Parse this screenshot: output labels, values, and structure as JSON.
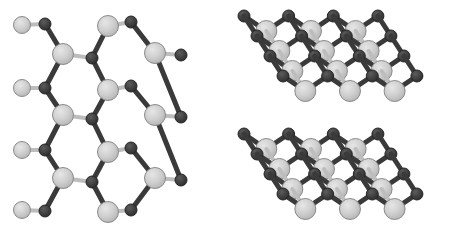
{
  "figure": {
    "title": "",
    "width": 462,
    "height": 236,
    "background": "#ffffff",
    "panels": [
      {
        "id": "left-panel",
        "name": "planar-projection",
        "label": "",
        "description": "Hexagonal lattice projection of a binary compound viewed along a principal axis"
      },
      {
        "id": "right-panel",
        "name": "layered-perspective",
        "label": "",
        "description": "Perspective view of two stacked puckered bilayers of the same binary compound"
      }
    ]
  },
  "style": {
    "atom_light_fill": "#c9c9c9",
    "atom_light_highlight": "#dedede",
    "atom_light_stroke": "#8a8a8a",
    "atom_dark_fill": "#3f3f3f",
    "atom_dark_highlight": "#565656",
    "atom_dark_stroke": "#262626",
    "bond_light_color": "#bdbdbd",
    "bond_dark_color": "#3a3a3a",
    "bond_light_width": 4,
    "bond_dark_width": 5,
    "atom_light_radius": 10.5,
    "atom_dark_radius": 7.0,
    "atom_light_radius_small": 8.5,
    "atom_dark_radius_small": 6.0
  },
  "legend": {
    "species": [
      {
        "key": "light",
        "label": "",
        "color": "#c9c9c9",
        "relative_size": "large"
      },
      {
        "key": "dark",
        "label": "",
        "color": "#3f3f3f",
        "relative_size": "small"
      }
    ]
  },
  "chart_data": {
    "type": "diagram",
    "title": "",
    "panels": [
      {
        "id": "left",
        "kind": "hexagonal-lattice-projection",
        "atoms": [
          {
            "x": 22,
            "y": 25,
            "s": "light",
            "size": "small"
          },
          {
            "x": 45,
            "y": 24,
            "s": "dark",
            "size": "small"
          },
          {
            "x": 63,
            "y": 54,
            "s": "light",
            "size": "large"
          },
          {
            "x": 92,
            "y": 58,
            "s": "dark",
            "size": "small"
          },
          {
            "x": 108,
            "y": 26,
            "s": "light",
            "size": "large"
          },
          {
            "x": 131,
            "y": 22,
            "s": "dark",
            "size": "small"
          },
          {
            "x": 155,
            "y": 53,
            "s": "light",
            "size": "large"
          },
          {
            "x": 181,
            "y": 55,
            "s": "dark",
            "size": "small"
          },
          {
            "x": 22,
            "y": 88,
            "s": "light",
            "size": "small"
          },
          {
            "x": 45,
            "y": 88,
            "s": "dark",
            "size": "small"
          },
          {
            "x": 63,
            "y": 115,
            "s": "light",
            "size": "large"
          },
          {
            "x": 92,
            "y": 119,
            "s": "dark",
            "size": "small"
          },
          {
            "x": 108,
            "y": 90,
            "s": "light",
            "size": "large"
          },
          {
            "x": 131,
            "y": 86,
            "s": "dark",
            "size": "small"
          },
          {
            "x": 155,
            "y": 115,
            "s": "light",
            "size": "large"
          },
          {
            "x": 181,
            "y": 117,
            "s": "dark",
            "size": "small"
          },
          {
            "x": 22,
            "y": 150,
            "s": "light",
            "size": "small"
          },
          {
            "x": 45,
            "y": 150,
            "s": "dark",
            "size": "small"
          },
          {
            "x": 63,
            "y": 178,
            "s": "light",
            "size": "large"
          },
          {
            "x": 92,
            "y": 182,
            "s": "dark",
            "size": "small"
          },
          {
            "x": 108,
            "y": 152,
            "s": "light",
            "size": "large"
          },
          {
            "x": 131,
            "y": 148,
            "s": "dark",
            "size": "small"
          },
          {
            "x": 155,
            "y": 178,
            "s": "light",
            "size": "large"
          },
          {
            "x": 181,
            "y": 180,
            "s": "dark",
            "size": "small"
          },
          {
            "x": 22,
            "y": 210,
            "s": "light",
            "size": "small"
          },
          {
            "x": 45,
            "y": 211,
            "s": "dark",
            "size": "small"
          },
          {
            "x": 108,
            "y": 212,
            "s": "light",
            "size": "large"
          },
          {
            "x": 131,
            "y": 210,
            "s": "dark",
            "size": "small"
          }
        ],
        "bonds": [
          [
            0,
            1,
            "light"
          ],
          [
            1,
            2,
            "dark"
          ],
          [
            2,
            3,
            "light"
          ],
          [
            3,
            4,
            "dark"
          ],
          [
            4,
            5,
            "light"
          ],
          [
            5,
            6,
            "dark"
          ],
          [
            6,
            7,
            "light"
          ],
          [
            2,
            9,
            "dark"
          ],
          [
            3,
            12,
            "dark"
          ],
          [
            6,
            15,
            "dark"
          ],
          [
            8,
            9,
            "light"
          ],
          [
            9,
            10,
            "dark"
          ],
          [
            10,
            11,
            "light"
          ],
          [
            11,
            12,
            "dark"
          ],
          [
            12,
            13,
            "light"
          ],
          [
            13,
            14,
            "dark"
          ],
          [
            14,
            15,
            "light"
          ],
          [
            10,
            17,
            "dark"
          ],
          [
            11,
            20,
            "dark"
          ],
          [
            14,
            23,
            "dark"
          ],
          [
            16,
            17,
            "light"
          ],
          [
            17,
            18,
            "dark"
          ],
          [
            18,
            19,
            "light"
          ],
          [
            19,
            20,
            "dark"
          ],
          [
            20,
            21,
            "light"
          ],
          [
            21,
            22,
            "dark"
          ],
          [
            22,
            23,
            "light"
          ],
          [
            18,
            25,
            "dark"
          ],
          [
            19,
            26,
            "dark"
          ],
          [
            22,
            27,
            "dark"
          ],
          [
            24,
            25,
            "light"
          ],
          [
            26,
            27,
            "light"
          ]
        ]
      },
      {
        "id": "right",
        "kind": "stacked-puckered-bilayers",
        "layers": 2,
        "rows_per_layer": 4,
        "zigzag_period": 2,
        "note": "Each layer is a corrugated sheet; rows are offset diagonally to convey depth."
      }
    ]
  }
}
